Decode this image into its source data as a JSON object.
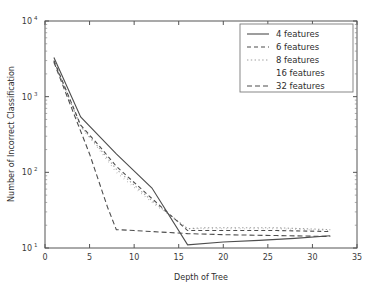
{
  "chart_data": {
    "type": "line",
    "title": "",
    "xlabel": "Depth of Tree",
    "ylabel": "Number of Incorrect Classification",
    "xlim": [
      0,
      35
    ],
    "ylim": [
      10,
      10000
    ],
    "yscale": "log",
    "xticks": [
      "0",
      "5",
      "10",
      "15",
      "20",
      "25",
      "30",
      "35"
    ],
    "xtick_values": [
      0,
      5,
      10,
      15,
      20,
      25,
      30,
      35
    ],
    "yticks": [
      "10^1",
      "10^2",
      "10^3",
      "10^4"
    ],
    "ytick_bases": [
      "10",
      "10",
      "10",
      "10"
    ],
    "ytick_exponents": [
      "1",
      "2",
      "3",
      "4"
    ],
    "ytick_values": [
      10,
      100,
      1000,
      10000
    ],
    "grid": false,
    "legend_position": "upper right",
    "line_color": "#4d4d4d",
    "series": [
      {
        "name": "4 features",
        "style": "solid",
        "dash": "none",
        "x": [
          1,
          4,
          8,
          12,
          16,
          20,
          24,
          28,
          32
        ],
        "values": [
          3300,
          540,
          175,
          62,
          11,
          12,
          12.6,
          13.4,
          14.5
        ]
      },
      {
        "name": "6 features",
        "style": "dashed",
        "dash": "4,3",
        "x": [
          1,
          4,
          6,
          8,
          12,
          16,
          18,
          22,
          26,
          32
        ],
        "values": [
          3000,
          420,
          230,
          120,
          45,
          17,
          17,
          17,
          17,
          16.5
        ]
      },
      {
        "name": "8 features",
        "style": "dotted",
        "dash": "1.4,2.4",
        "x": [
          1,
          4,
          6,
          8,
          12,
          16,
          18,
          22,
          26,
          32
        ],
        "values": [
          2950,
          410,
          215,
          110,
          42,
          18,
          18.5,
          18.5,
          18.5,
          17.5
        ]
      },
      {
        "name": "16 features",
        "style": "none",
        "dash": "0.6,4",
        "x": [
          1,
          4,
          6,
          8,
          12,
          16,
          18,
          22,
          26,
          32
        ],
        "values": [
          2900,
          400,
          205,
          100,
          40,
          18,
          18,
          18,
          18,
          17
        ]
      },
      {
        "name": "32 features",
        "style": "dashed-long",
        "dash": "5,3",
        "x": [
          1,
          3,
          5,
          7,
          8,
          10,
          14,
          16,
          20,
          26,
          32
        ],
        "values": [
          2850,
          700,
          175,
          35,
          17.5,
          17,
          16,
          15.5,
          15,
          14.6,
          14.2
        ]
      }
    ]
  }
}
